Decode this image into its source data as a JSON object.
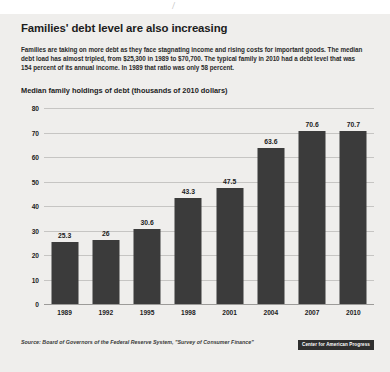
{
  "headline": "Families' debt level are also increasing",
  "deck": "Families are taking on more debt as they face stagnating income and rising costs for important goods. The median debt load has almost tripled, from $25,300 in 1989 to $70,700. The typical family in 2010 had a debt level that was 154 percent of its annual income. In 1989 that ratio was only 58 percent.",
  "source": "Source: Board of Governors of the Federal Reserve System, \"Survey of Consumer Finance\"",
  "logo": "Center for American Progress",
  "scan_mark": "/",
  "colors": {
    "bar": "#3b3b3b",
    "page_background": "#efeeec",
    "gridline": "#c6c5c3",
    "text": "#1c1c1c",
    "badge_background": "#2f2f2f"
  },
  "chart_data": {
    "type": "bar",
    "title": "Median family holdings of debt (thousands of 2010 dollars)",
    "xlabel": "",
    "ylabel": "",
    "categories": [
      "1989",
      "1992",
      "1995",
      "1998",
      "2001",
      "2004",
      "2007",
      "2010"
    ],
    "values": [
      25.3,
      26,
      30.6,
      43.3,
      47.5,
      63.6,
      70.6,
      70.7
    ],
    "value_labels": [
      "25.3",
      "26",
      "30.6",
      "43.3",
      "47.5",
      "63.6",
      "70.6",
      "70.7"
    ],
    "ylim": [
      0,
      80
    ],
    "yticks": [
      0,
      10,
      20,
      30,
      40,
      50,
      60,
      70,
      80
    ],
    "ytick_labels": [
      "0",
      "10",
      "20",
      "30",
      "40",
      "50",
      "60",
      "70",
      "80"
    ],
    "grid": true,
    "legend": false
  }
}
